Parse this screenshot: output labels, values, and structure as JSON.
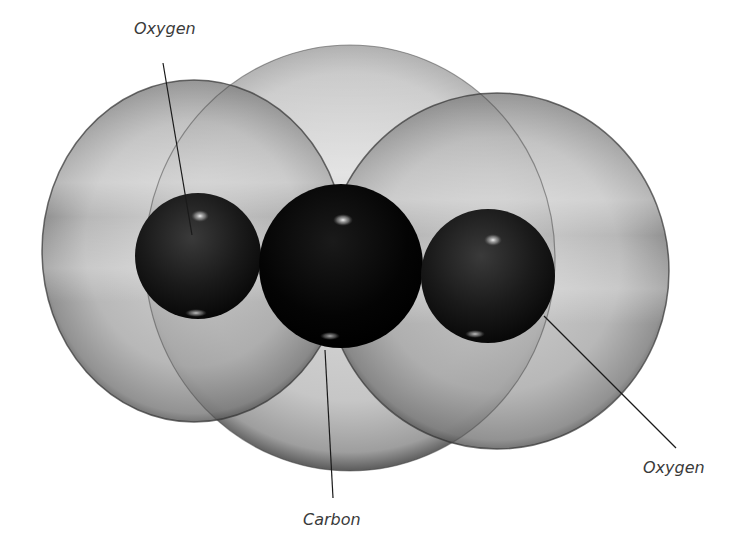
{
  "diagram": {
    "title": "Carbon dioxide molecule (space-filling model)",
    "labels": {
      "oxygen_left": "Oxygen",
      "oxygen_right": "Oxygen",
      "carbon": "Carbon"
    },
    "atoms": [
      {
        "name": "Oxygen",
        "position": "left",
        "nucleus_color": "#151515",
        "cloud_color": "#9a9a9a"
      },
      {
        "name": "Carbon",
        "position": "center",
        "nucleus_color": "#050505",
        "cloud_color": "#c4c4c4"
      },
      {
        "name": "Oxygen",
        "position": "right",
        "nucleus_color": "#151515",
        "cloud_color": "#9a9a9a"
      }
    ],
    "colors": {
      "background": "#ffffff",
      "label_text": "#3a3a3a",
      "leader_line": "#1a1a1a"
    }
  }
}
